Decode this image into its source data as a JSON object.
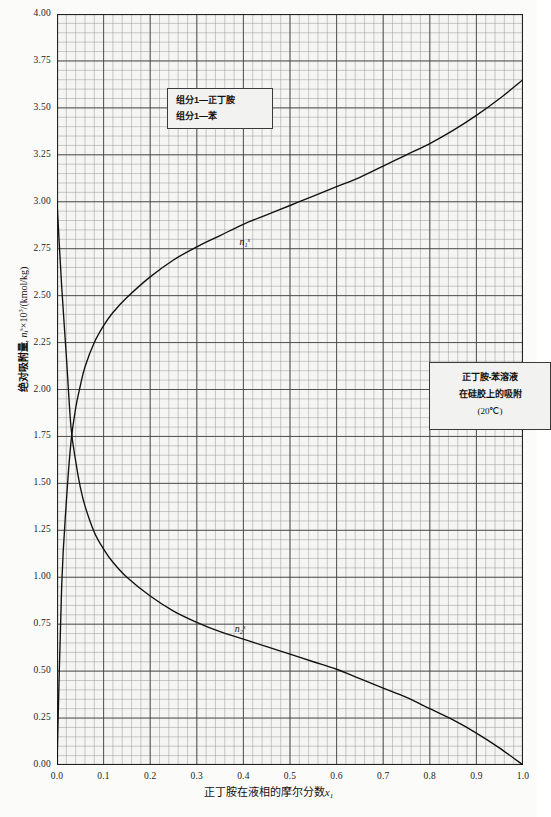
{
  "chart_data": {
    "type": "line",
    "title": "",
    "xlabel": "正丁胺在液相的摩尔分数x₁",
    "ylabel": "绝对吸附量, nᵢˢ×10³/(kmol/kg)",
    "xlim": [
      0.0,
      1.0
    ],
    "ylim": [
      0.0,
      4.0
    ],
    "grid": true,
    "legend_position": "inside-upper-left",
    "xticks": [
      "0.0",
      "0.1",
      "0.2",
      "0.3",
      "0.4",
      "0.5",
      "0.6",
      "0.7",
      "0.8",
      "0.9",
      "1.0"
    ],
    "yticks": [
      "0.00",
      "0.25",
      "0.50",
      "0.75",
      "1.00",
      "1.25",
      "1.50",
      "1.75",
      "2.00",
      "2.25",
      "2.50",
      "2.75",
      "3.00",
      "3.25",
      "3.50",
      "3.75",
      "4.00"
    ],
    "x_minor_step": 0.02,
    "y_minor_step": 0.05,
    "series": [
      {
        "name": "n₁ˢ",
        "label": "n-butylamine absolute adsorption",
        "color": "#111111",
        "x": [
          0.0,
          0.01,
          0.02,
          0.03,
          0.04,
          0.05,
          0.06,
          0.08,
          0.1,
          0.12,
          0.15,
          0.2,
          0.25,
          0.3,
          0.35,
          0.4,
          0.45,
          0.5,
          0.55,
          0.6,
          0.65,
          0.7,
          0.75,
          0.8,
          0.85,
          0.9,
          0.95,
          1.0
        ],
        "y": [
          0.0,
          0.95,
          1.4,
          1.72,
          1.9,
          2.02,
          2.12,
          2.25,
          2.34,
          2.41,
          2.49,
          2.6,
          2.69,
          2.76,
          2.82,
          2.88,
          2.93,
          2.98,
          3.03,
          3.08,
          3.13,
          3.19,
          3.25,
          3.31,
          3.38,
          3.46,
          3.55,
          3.65
        ]
      },
      {
        "name": "n₂ˢ",
        "label": "benzene absolute adsorption",
        "color": "#111111",
        "x": [
          0.0,
          0.01,
          0.02,
          0.03,
          0.04,
          0.05,
          0.06,
          0.08,
          0.1,
          0.12,
          0.15,
          0.2,
          0.25,
          0.3,
          0.35,
          0.4,
          0.45,
          0.5,
          0.55,
          0.6,
          0.65,
          0.7,
          0.75,
          0.8,
          0.85,
          0.9,
          0.95,
          1.0
        ],
        "y": [
          3.0,
          2.55,
          2.18,
          1.8,
          1.62,
          1.48,
          1.38,
          1.24,
          1.15,
          1.08,
          1.0,
          0.9,
          0.82,
          0.76,
          0.71,
          0.67,
          0.63,
          0.59,
          0.55,
          0.51,
          0.46,
          0.41,
          0.36,
          0.3,
          0.24,
          0.17,
          0.09,
          0.0
        ]
      }
    ],
    "curve_labels": [
      {
        "text": "n₁ˢ",
        "x": 0.4,
        "y": 2.78
      },
      {
        "text": "n₂ˢ",
        "x": 0.39,
        "y": 0.72
      }
    ]
  },
  "legend": {
    "line1": "组分1—正丁胺",
    "line2": "组分1—苯"
  },
  "note": {
    "line1": "正丁胺-苯溶液",
    "line2": "在硅胶上的吸附",
    "line3": "(20℃)"
  },
  "axes": {
    "ylabel_cn": "绝对吸附量",
    "ylabel_sym": "n",
    "ylabel_sym_sub": "i",
    "ylabel_sym_sup": "s",
    "ylabel_unit": "×10",
    "ylabel_unit_sup": "3",
    "ylabel_unit_tail": "/(kmol/kg)",
    "xlabel_cn": "正丁胺在液相的摩尔分数",
    "xlabel_sym": "x",
    "xlabel_sym_sub": "1"
  }
}
